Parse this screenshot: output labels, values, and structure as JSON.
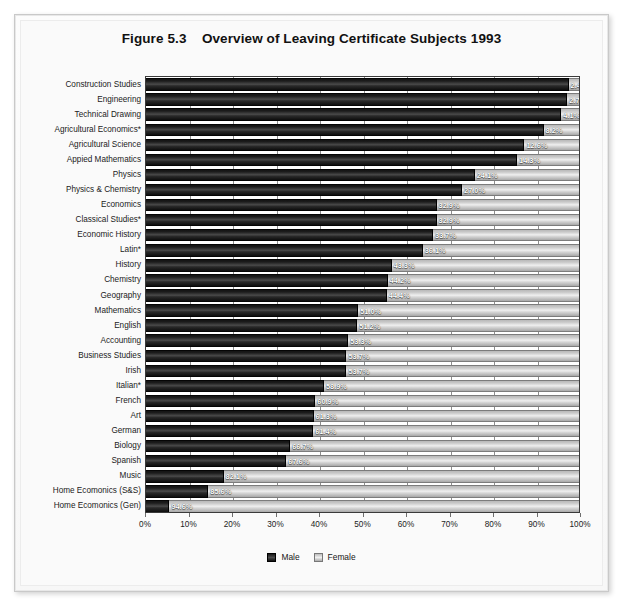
{
  "figure": {
    "label": "Figure 5.3",
    "title": "Overview of Leaving Certificate Subjects 1993",
    "full_title": "Figure 5.3    Overview of Leaving Certificate Subjects 1993"
  },
  "legend": {
    "male_label": "Male",
    "female_label": "Female"
  },
  "axis": {
    "xticks": [
      "0%",
      "10%",
      "20%",
      "30%",
      "40%",
      "50%",
      "60%",
      "70%",
      "80%",
      "90%",
      "100%"
    ]
  },
  "colors": {
    "male": "#1c1c1c",
    "female": "#d6d6d6",
    "plot_background": "#ffffff",
    "frame": "#c9c9c9",
    "label_text": "#1b1b1b",
    "value_text": "#ffffff"
  },
  "chart_data": {
    "type": "bar",
    "orientation": "horizontal",
    "stacked": true,
    "normalized": true,
    "title": "Overview of Leaving Certificate Subjects 1993",
    "xlabel": "",
    "ylabel": "",
    "xlim": [
      0,
      100
    ],
    "xticks": [
      0,
      10,
      20,
      30,
      40,
      50,
      60,
      70,
      80,
      90,
      100
    ],
    "grid": true,
    "legend_position": "bottom",
    "value_label_series": "Female",
    "categories": [
      "Construction Studies",
      "Engineering",
      "Technical Drawing",
      "Agricultural Economics*",
      "Agricultural Science",
      "Appied Mathematics",
      "Physics",
      "Physics & Chemistry",
      "Economics",
      "Classical Studies*",
      "Economic History",
      "Latin*",
      "History",
      "Chemistry",
      "Geography",
      "Mathematics",
      "English",
      "Accounting",
      "Business Studies",
      "Irish",
      "Italian*",
      "French",
      "Art",
      "German",
      "Biology",
      "Spanish",
      "Music",
      "Home Ecomonics (S&S)",
      "Home Ecomonics (Gen)"
    ],
    "series": [
      {
        "name": "Male",
        "values": [
          97.6,
          97.3,
          95.9,
          91.8,
          87.4,
          85.7,
          75.9,
          73.0,
          67.1,
          67.1,
          66.3,
          63.9,
          56.7,
          55.8,
          55.6,
          49.0,
          48.8,
          46.7,
          46.3,
          46.3,
          41.1,
          39.1,
          38.7,
          38.6,
          33.3,
          32.4,
          17.9,
          14.4,
          5.4
        ]
      },
      {
        "name": "Female",
        "values": [
          2.4,
          2.7,
          4.1,
          8.2,
          12.6,
          14.3,
          24.1,
          27.0,
          32.9,
          32.9,
          33.7,
          36.1,
          43.3,
          44.2,
          44.4,
          51.0,
          51.2,
          53.3,
          53.7,
          53.7,
          58.9,
          60.9,
          61.3,
          61.4,
          66.7,
          67.6,
          82.1,
          85.6,
          94.6
        ]
      }
    ],
    "value_labels": [
      "2.4%",
      "2.7%",
      "4.1%",
      "8.2%",
      "12.6%",
      "14.3%",
      "24.1%",
      "27.0%",
      "32.9%",
      "32.9%",
      "33.7%",
      "36.1%",
      "43.3%",
      "44.2%",
      "44.4%",
      "51.0%",
      "51.2%",
      "53.3%",
      "53.7%",
      "53.7%",
      "58.9%",
      "60.9%",
      "61.3%",
      "61.4%",
      "66.7%",
      "67.6%",
      "82.1%",
      "85.6%",
      "94.6%"
    ]
  }
}
